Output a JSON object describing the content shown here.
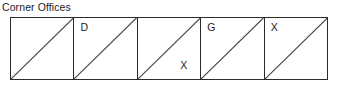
{
  "diagram": {
    "title": "Corner Offices",
    "type": "cell-strip",
    "orientation": "horizontal",
    "cell_count": 5,
    "diagonal_direction": "bottom-left-to-top-right",
    "border_color": "#2b2b2b",
    "diagonal_color": "#4a4a4a",
    "background_color": "#ffffff",
    "text_color": "#1c1c1c",
    "cells": [
      {
        "index": 1,
        "label": "",
        "label_position": "none"
      },
      {
        "index": 2,
        "label": "D",
        "label_position": "top-left"
      },
      {
        "index": 3,
        "label": "X",
        "label_position": "bottom-right"
      },
      {
        "index": 4,
        "label": "G",
        "label_position": "top-left"
      },
      {
        "index": 5,
        "label": "X",
        "label_position": "top-left"
      }
    ]
  }
}
